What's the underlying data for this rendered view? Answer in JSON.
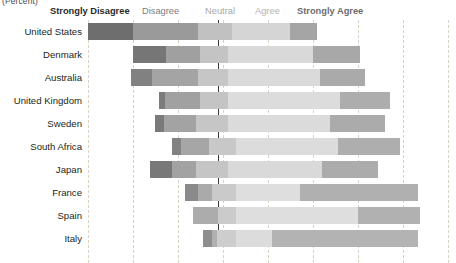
{
  "caption": "(Percent)",
  "legend": {
    "items": [
      {
        "label": "Strongly Disagree",
        "color": "#6e6e6e"
      },
      {
        "label": "Disagree",
        "color": "#9a9a9a"
      },
      {
        "label": "Neutral",
        "color": "#c0c0c0"
      },
      {
        "label": "Agree",
        "color": "#d2d2d2"
      },
      {
        "label": "Strongly Agree",
        "color": "#a5a5a5"
      }
    ]
  },
  "axis": {
    "zero_label": "Neutral midpoint",
    "gridline_positions_px": [
      88,
      133,
      178,
      223,
      268,
      313,
      358,
      403,
      448
    ],
    "zero_position_px": 218
  },
  "chart_data": {
    "type": "bar",
    "subtype": "diverging-stacked-likert",
    "title": "",
    "subtitle": "",
    "xlabel": "(Percent)",
    "ylabel": "",
    "grid": true,
    "legend_position": "top",
    "categories": [
      "United States",
      "Denmark",
      "Australia",
      "United Kingdom",
      "Sweden",
      "South Africa",
      "Japan",
      "France",
      "Spain",
      "Italy"
    ],
    "response_levels": [
      "Strongly Disagree",
      "Disagree",
      "Neutral",
      "Agree",
      "Strongly Agree"
    ],
    "series": [
      {
        "name": "Strongly Disagree",
        "color": "#6e6e6e",
        "values": [
          20,
          15,
          9,
          2,
          4,
          4,
          10,
          6,
          0,
          4
        ]
      },
      {
        "name": "Disagree",
        "color": "#9a9a9a",
        "values": [
          29,
          15,
          20,
          16,
          15,
          12,
          11,
          6,
          11,
          2
        ]
      },
      {
        "name": "Neutral",
        "color": "#c0c0c0",
        "values": [
          15,
          25,
          26,
          25,
          28,
          24,
          28,
          21,
          16,
          9
        ]
      },
      {
        "name": "Agree",
        "color": "#d2d2d2",
        "values": [
          26,
          38,
          41,
          50,
          45,
          45,
          42,
          28,
          54,
          16
        ]
      },
      {
        "name": "Strongly Agree",
        "color": "#a5a5a5",
        "values": [
          12,
          21,
          20,
          22,
          24,
          28,
          25,
          52,
          28,
          56
        ]
      }
    ],
    "bars_px": [
      {
        "category": "United States",
        "segments": [
          {
            "level": "Strongly Disagree",
            "x": 88,
            "w": 45,
            "color": "#6e6e6e"
          },
          {
            "level": "Disagree",
            "x": 133,
            "w": 65,
            "color": "#9a9a9a"
          },
          {
            "level": "Neutral",
            "x": 198,
            "w": 34,
            "color": "#c1c1c1"
          },
          {
            "level": "Agree",
            "x": 232,
            "w": 58,
            "color": "#d5d5d5"
          },
          {
            "level": "Strongly Agree",
            "x": 290,
            "w": 27,
            "color": "#a5a5a5"
          }
        ]
      },
      {
        "category": "Denmark",
        "segments": [
          {
            "level": "Strongly Disagree",
            "x": 133,
            "w": 33,
            "color": "#767676"
          },
          {
            "level": "Disagree",
            "x": 166,
            "w": 34,
            "color": "#a0a0a0"
          },
          {
            "level": "Neutral",
            "x": 200,
            "w": 28,
            "color": "#c4c4c4"
          },
          {
            "level": "Agree",
            "x": 228,
            "w": 85,
            "color": "#d9d9d9"
          },
          {
            "level": "Strongly Agree",
            "x": 313,
            "w": 47,
            "color": "#a8a8a8"
          }
        ]
      },
      {
        "category": "Australia",
        "segments": [
          {
            "level": "Strongly Disagree",
            "x": 131,
            "w": 21,
            "color": "#818181"
          },
          {
            "level": "Disagree",
            "x": 152,
            "w": 46,
            "color": "#a4a4a4"
          },
          {
            "level": "Neutral",
            "x": 198,
            "w": 30,
            "color": "#c6c6c6"
          },
          {
            "level": "Agree",
            "x": 228,
            "w": 92,
            "color": "#dadada"
          },
          {
            "level": "Strongly Agree",
            "x": 320,
            "w": 45,
            "color": "#aaaaaa"
          }
        ]
      },
      {
        "category": "United Kingdom",
        "segments": [
          {
            "level": "Strongly Disagree",
            "x": 159,
            "w": 6,
            "color": "#7c7c7c"
          },
          {
            "level": "Disagree",
            "x": 165,
            "w": 35,
            "color": "#a1a1a1"
          },
          {
            "level": "Neutral",
            "x": 200,
            "w": 28,
            "color": "#c4c4c4"
          },
          {
            "level": "Agree",
            "x": 228,
            "w": 112,
            "color": "#dcdcdc"
          },
          {
            "level": "Strongly Agree",
            "x": 340,
            "w": 50,
            "color": "#adadad"
          }
        ]
      },
      {
        "category": "Sweden",
        "segments": [
          {
            "level": "Strongly Disagree",
            "x": 155,
            "w": 9,
            "color": "#7a7a7a"
          },
          {
            "level": "Disagree",
            "x": 164,
            "w": 32,
            "color": "#a3a3a3"
          },
          {
            "level": "Neutral",
            "x": 196,
            "w": 32,
            "color": "#c6c6c6"
          },
          {
            "level": "Agree",
            "x": 228,
            "w": 102,
            "color": "#dbdbdb"
          },
          {
            "level": "Strongly Agree",
            "x": 330,
            "w": 55,
            "color": "#ababab"
          }
        ]
      },
      {
        "category": "South Africa",
        "segments": [
          {
            "level": "Strongly Disagree",
            "x": 172,
            "w": 9,
            "color": "#828282"
          },
          {
            "level": "Disagree",
            "x": 181,
            "w": 28,
            "color": "#a6a6a6"
          },
          {
            "level": "Neutral",
            "x": 209,
            "w": 27,
            "color": "#c8c8c8"
          },
          {
            "level": "Agree",
            "x": 236,
            "w": 102,
            "color": "#dcdcdc"
          },
          {
            "level": "Strongly Agree",
            "x": 338,
            "w": 62,
            "color": "#aeaeae"
          }
        ]
      },
      {
        "category": "Japan",
        "segments": [
          {
            "level": "Strongly Disagree",
            "x": 150,
            "w": 22,
            "color": "#787878"
          },
          {
            "level": "Disagree",
            "x": 172,
            "w": 24,
            "color": "#a2a2a2"
          },
          {
            "level": "Neutral",
            "x": 196,
            "w": 32,
            "color": "#c5c5c5"
          },
          {
            "level": "Agree",
            "x": 228,
            "w": 94,
            "color": "#d9d9d9"
          },
          {
            "level": "Strongly Agree",
            "x": 322,
            "w": 56,
            "color": "#acacac"
          }
        ]
      },
      {
        "category": "France",
        "segments": [
          {
            "level": "Strongly Disagree",
            "x": 185,
            "w": 13,
            "color": "#8a8a8a"
          },
          {
            "level": "Disagree",
            "x": 198,
            "w": 14,
            "color": "#aaaaaa"
          },
          {
            "level": "Neutral",
            "x": 212,
            "w": 24,
            "color": "#cacaca"
          },
          {
            "level": "Agree",
            "x": 236,
            "w": 64,
            "color": "#dedede"
          },
          {
            "level": "Strongly Agree",
            "x": 300,
            "w": 118,
            "color": "#b0b0b0"
          }
        ]
      },
      {
        "category": "Spain",
        "segments": [
          {
            "level": "Strongly Disagree",
            "x": 193,
            "w": 0,
            "color": "#8a8a8a"
          },
          {
            "level": "Disagree",
            "x": 193,
            "w": 25,
            "color": "#acacac"
          },
          {
            "level": "Neutral",
            "x": 218,
            "w": 18,
            "color": "#cbcbcb"
          },
          {
            "level": "Agree",
            "x": 236,
            "w": 122,
            "color": "#dedede"
          },
          {
            "level": "Strongly Agree",
            "x": 358,
            "w": 62,
            "color": "#b1b1b1"
          }
        ]
      },
      {
        "category": "Italy",
        "segments": [
          {
            "level": "Strongly Disagree",
            "x": 203,
            "w": 9,
            "color": "#8e8e8e"
          },
          {
            "level": "Disagree",
            "x": 212,
            "w": 5,
            "color": "#b0b0b0"
          },
          {
            "level": "Neutral",
            "x": 217,
            "w": 19,
            "color": "#cdcdcd"
          },
          {
            "level": "Agree",
            "x": 236,
            "w": 36,
            "color": "#dcdcdc"
          },
          {
            "level": "Strongly Agree",
            "x": 272,
            "w": 146,
            "color": "#b3b3b3"
          }
        ]
      }
    ]
  }
}
